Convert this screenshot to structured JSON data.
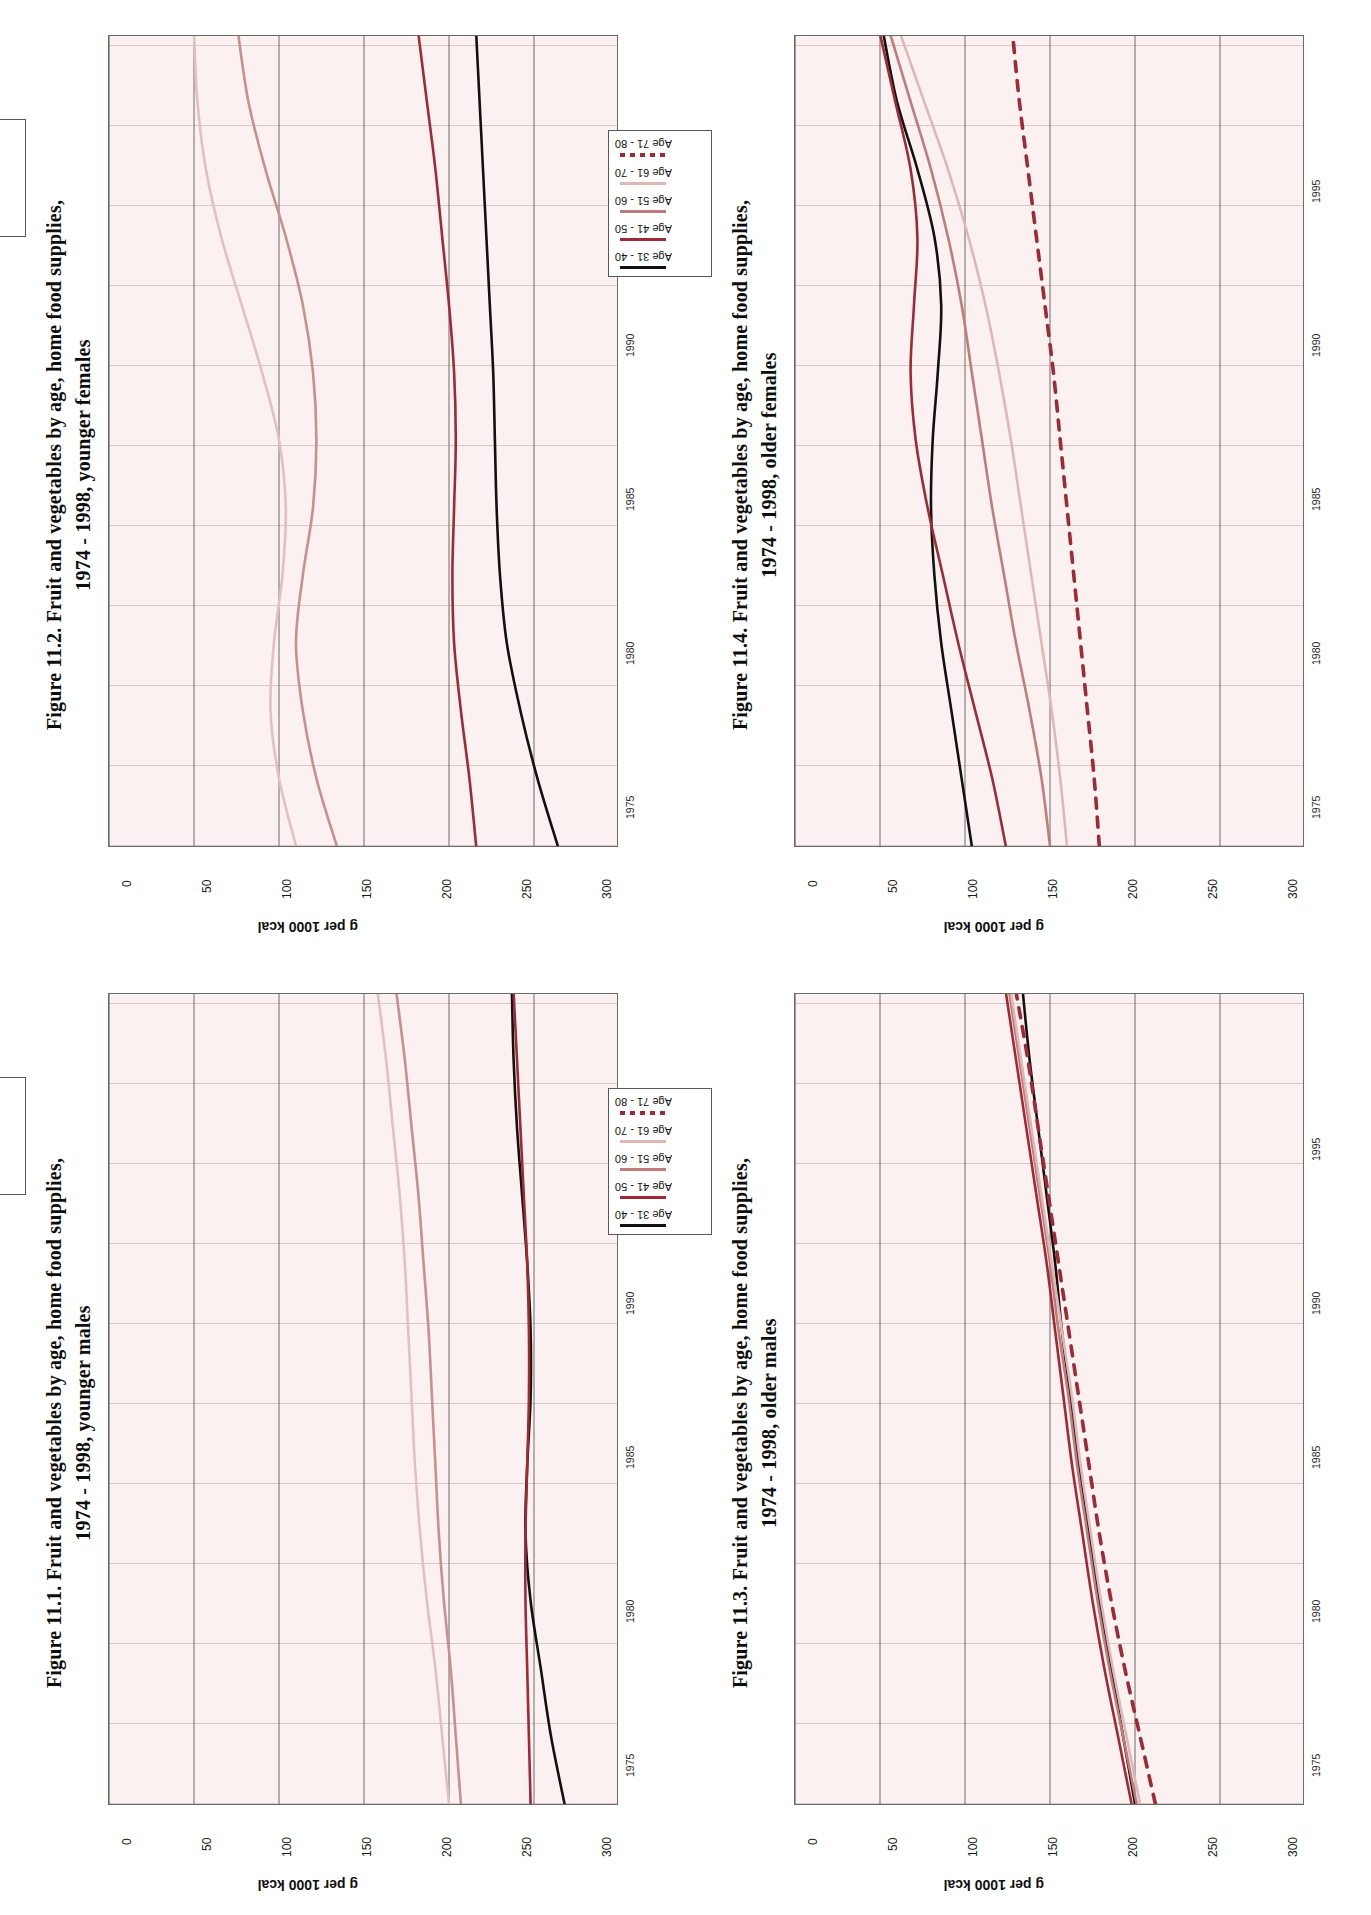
{
  "page": {
    "orientation": "landscape-content-on-portrait-page",
    "background": "#ffffff"
  },
  "palette": {
    "black": "#111111",
    "dark_red": "#9e2a35",
    "mid_rose": "#c07c7c",
    "light_rose": "#dbaeae",
    "pale_pink": "#e8c9c9",
    "dashed_red": "#9e2a35",
    "plot_bg": "#fbf1f0",
    "grid": "#cdb9b8",
    "axis": "#4a4a4a"
  },
  "common": {
    "ylabel": "g per 1000 kcal",
    "yticks": [
      "0",
      "50",
      "100",
      "150",
      "200",
      "250",
      "300"
    ],
    "xticks": [
      "1975",
      "1980",
      "1985",
      "1990",
      "1995"
    ],
    "ylim": [
      0,
      300
    ],
    "xlim": [
      1974,
      1998
    ]
  },
  "figures": [
    {
      "id": "fig-11-1",
      "title": "Figure 11.1. Fruit and vegetables by age, home food supplies,\n1974 - 1998, younger males",
      "legend": [
        {
          "label": "Age 1 - 10",
          "color": "#111111",
          "dash": false
        },
        {
          "label": "Age 11 - 20",
          "color": "#9e2a35",
          "dash": false
        },
        {
          "label": "Age 21 - 30",
          "color": "#c98f8f",
          "dash": false
        },
        {
          "label": "Age 31 - 40",
          "color": "#e3bfbf",
          "dash": false
        }
      ],
      "chart_data": {
        "type": "line",
        "title": "Figure 11.1. Fruit and vegetables by age, home food supplies, 1974 - 1998, younger males",
        "xlabel": "",
        "ylabel": "g per 1000 kcal",
        "ylim": [
          0,
          300
        ],
        "xlim": [
          1974,
          1998
        ],
        "grid": true,
        "legend_position": "top-right",
        "x": [
          1974,
          1976,
          1978,
          1980,
          1982,
          1984,
          1986,
          1988,
          1990,
          1992,
          1994,
          1996,
          1998
        ],
        "series": [
          {
            "name": "Age 1 - 10",
            "color": "#111111",
            "dash": false,
            "values": [
              32,
              40,
              46,
              52,
              55,
              54,
              52,
              52,
              54,
              57,
              60,
              62,
              63
            ]
          },
          {
            "name": "Age 11 - 20",
            "color": "#9e2a35",
            "dash": false,
            "values": [
              52,
              53,
              54,
              55,
              55,
              54,
              53,
              53,
              54,
              56,
              58,
              60,
              62
            ]
          },
          {
            "name": "Age 21 - 30",
            "color": "#c98f8f",
            "dash": false,
            "values": [
              93,
              96,
              99,
              103,
              106,
              108,
              110,
              112,
              115,
              118,
              122,
              126,
              131
            ]
          },
          {
            "name": "Age 31 - 40",
            "color": "#e3bfbf",
            "dash": false,
            "values": [
              100,
              104,
              108,
              113,
              117,
              120,
              122,
              124,
              126,
              129,
              133,
              137,
              142
            ]
          }
        ]
      }
    },
    {
      "id": "fig-11-2",
      "title": "Figure 11.2. Fruit and vegetables  by age, home food supplies,\n1974 - 1998, younger females",
      "legend": [
        {
          "label": "Age 1 - 10",
          "color": "#111111",
          "dash": false
        },
        {
          "label": "Age 11 - 20",
          "color": "#9e2a35",
          "dash": false
        },
        {
          "label": "Age 21 - 30",
          "color": "#c98f8f",
          "dash": false
        },
        {
          "label": "Age 31 - 40",
          "color": "#e3bfbf",
          "dash": false
        }
      ],
      "chart_data": {
        "type": "line",
        "title": "Figure 11.2. Fruit and vegetables by age, home food supplies, 1974 - 1998, younger females",
        "xlabel": "",
        "ylabel": "g per 1000 kcal",
        "ylim": [
          0,
          300
        ],
        "xlim": [
          1974,
          1998
        ],
        "grid": true,
        "legend_position": "top-right",
        "x": [
          1974,
          1976,
          1978,
          1980,
          1982,
          1984,
          1986,
          1988,
          1990,
          1992,
          1994,
          1996,
          1998
        ],
        "series": [
          {
            "name": "Age 1 - 10",
            "color": "#111111",
            "dash": false,
            "values": [
              36,
              48,
              58,
              66,
              70,
              72,
              73,
              74,
              76,
              78,
              80,
              82,
              84
            ]
          },
          {
            "name": "Age 11 - 20",
            "color": "#9e2a35",
            "dash": false,
            "values": [
              84,
              88,
              93,
              97,
              98,
              97,
              96,
              97,
              100,
              104,
              108,
              113,
              118
            ]
          },
          {
            "name": "Age 21 - 30",
            "color": "#c98f8f",
            "dash": false,
            "values": [
              166,
              178,
              186,
              190,
              186,
              180,
              178,
              180,
              186,
              196,
              208,
              218,
              224
            ]
          },
          {
            "name": "Age 31 - 40",
            "color": "#e3bfbf",
            "dash": false,
            "values": [
              190,
              200,
              205,
              203,
              198,
              196,
              200,
              210,
              222,
              234,
              243,
              248,
              250
            ]
          }
        ]
      }
    },
    {
      "id": "fig-11-3",
      "title": "Figure 11.3. Fruit and vegetables by age, home food supplies,\n1974 - 1998, older males",
      "legend": [
        {
          "label": "Age 31 - 40",
          "color": "#111111",
          "dash": false
        },
        {
          "label": "Age 41 - 50",
          "color": "#9e2a35",
          "dash": false
        },
        {
          "label": "Age 51 - 60",
          "color": "#c07c7c",
          "dash": false
        },
        {
          "label": "Age 61 - 70",
          "color": "#e0b6b6",
          "dash": false
        },
        {
          "label": "Age 71 - 80",
          "color": "#9e2a35",
          "dash": true
        }
      ],
      "chart_data": {
        "type": "line",
        "title": "Figure 11.3. Fruit and vegetables by age, home food supplies, 1974 - 1998, older males",
        "xlabel": "",
        "ylabel": "g per 1000 kcal",
        "ylim": [
          0,
          300
        ],
        "xlim": [
          1974,
          1998
        ],
        "grid": true,
        "legend_position": "top-right",
        "x": [
          1974,
          1976,
          1978,
          1980,
          1982,
          1984,
          1986,
          1988,
          1990,
          1992,
          1994,
          1996,
          1998
        ],
        "series": [
          {
            "name": "Age 31 - 40",
            "color": "#111111",
            "dash": false,
            "values": [
              100,
              107,
              114,
              121,
              127,
              133,
              138,
              143,
              147,
              152,
              157,
              162,
              166
            ]
          },
          {
            "name": "Age 41 - 50",
            "color": "#9e2a35",
            "dash": false,
            "values": [
              102,
              110,
              118,
              125,
              131,
              137,
              142,
              147,
              152,
              158,
              164,
              170,
              176
            ]
          },
          {
            "name": "Age 51 - 60",
            "color": "#c07c7c",
            "dash": false,
            "values": [
              99,
              107,
              115,
              122,
              128,
              134,
              139,
              145,
              150,
              156,
              162,
              168,
              174
            ]
          },
          {
            "name": "Age 61 - 70",
            "color": "#e0b6b6",
            "dash": false,
            "values": [
              97,
              105,
              113,
              120,
              126,
              132,
              137,
              143,
              149,
              155,
              161,
              167,
              173
            ]
          },
          {
            "name": "Age 71 - 80",
            "color": "#9e2a35",
            "dash": true,
            "values": [
              88,
              97,
              106,
              114,
              121,
              127,
              133,
              139,
              145,
              151,
              157,
              163,
              170
            ]
          }
        ]
      }
    },
    {
      "id": "fig-11-4",
      "title": "Figure 11.4. Fruit and vegetables by age, home food supplies,\n1974 - 1998, older females",
      "legend": [
        {
          "label": "Age 31 - 40",
          "color": "#111111",
          "dash": false
        },
        {
          "label": "Age 41 - 50",
          "color": "#9e2a35",
          "dash": false
        },
        {
          "label": "Age 51 - 60",
          "color": "#c07c7c",
          "dash": false
        },
        {
          "label": "Age 61 - 70",
          "color": "#e0b6b6",
          "dash": false
        },
        {
          "label": "Age 71 - 80",
          "color": "#9e2a35",
          "dash": true
        }
      ],
      "chart_data": {
        "type": "line",
        "title": "Figure 11.4. Fruit and vegetables by age, home food supplies, 1974 - 1998, older females",
        "xlabel": "",
        "ylabel": "g per 1000 kcal",
        "ylim": [
          0,
          300
        ],
        "xlim": [
          1974,
          1998
        ],
        "grid": true,
        "legend_position": "top-right",
        "x": [
          1974,
          1976,
          1978,
          1980,
          1982,
          1984,
          1986,
          1988,
          1990,
          1992,
          1994,
          1996,
          1998
        ],
        "series": [
          {
            "name": "Age 31 - 40",
            "color": "#111111",
            "dash": false,
            "values": [
              196,
              202,
              208,
              214,
              218,
              220,
              219,
              216,
              214,
              218,
              228,
              240,
              248
            ]
          },
          {
            "name": "Age 41 - 50",
            "color": "#9e2a35",
            "dash": false,
            "values": [
              176,
              184,
              194,
              204,
              213,
              222,
              229,
              232,
              230,
              228,
              232,
              241,
              250
            ]
          },
          {
            "name": "Age 51 - 60",
            "color": "#c07c7c",
            "dash": false,
            "values": [
              150,
              155,
              162,
              170,
              177,
              184,
              190,
              196,
              202,
              210,
              220,
              232,
              244
            ]
          },
          {
            "name": "Age 61 - 70",
            "color": "#e0b6b6",
            "dash": false,
            "values": [
              140,
              144,
              149,
              155,
              161,
              167,
              173,
              180,
              188,
              198,
              210,
              224,
              238
            ]
          },
          {
            "name": "Age 71 - 80",
            "color": "#9e2a35",
            "dash": true,
            "values": [
              121,
              124,
              128,
              132,
              136,
              140,
              144,
              148,
              153,
              158,
              163,
              168,
              172
            ]
          }
        ]
      }
    }
  ]
}
